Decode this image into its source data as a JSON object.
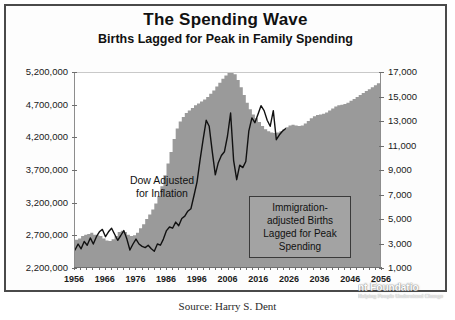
{
  "chart_data": {
    "type": "area",
    "title": "The Spending Wave",
    "subtitle": "Births Lagged for Peak in Family Spending",
    "xlabel": "",
    "ylabel": "",
    "grid": false,
    "legend_position": "none",
    "x": [
      1956,
      1957,
      1958,
      1959,
      1960,
      1961,
      1962,
      1963,
      1964,
      1965,
      1966,
      1967,
      1968,
      1969,
      1970,
      1971,
      1972,
      1973,
      1974,
      1975,
      1976,
      1977,
      1978,
      1979,
      1980,
      1981,
      1982,
      1983,
      1984,
      1985,
      1986,
      1987,
      1988,
      1989,
      1990,
      1991,
      1992,
      1993,
      1994,
      1995,
      1996,
      1997,
      1998,
      1999,
      2000,
      2001,
      2002,
      2003,
      2004,
      2005,
      2006,
      2007,
      2008,
      2009,
      2010,
      2011,
      2012,
      2013,
      2014,
      2015,
      2016,
      2017,
      2018,
      2019,
      2020,
      2021,
      2022,
      2023,
      2024,
      2025,
      2026,
      2027,
      2028,
      2029,
      2030,
      2031,
      2032,
      2033,
      2034,
      2035,
      2036,
      2037,
      2038,
      2039,
      2040,
      2041,
      2042,
      2043,
      2044,
      2045,
      2046,
      2047,
      2048,
      2049,
      2050,
      2051,
      2052,
      2053,
      2054,
      2055,
      2056
    ],
    "x_tick_labels": [
      "1956",
      "1966",
      "1976",
      "1986",
      "1996",
      "2006",
      "2016",
      "2026",
      "2036",
      "2046",
      "2056"
    ],
    "axes": [
      {
        "name": "left",
        "title": "Immigration-adjusted Births Lagged for Peak Spending",
        "ticks": [
          "2,200,000",
          "2,700,000",
          "3,200,000",
          "3,700,000",
          "4,200,000",
          "4,700,000",
          "5,200,000"
        ],
        "range": [
          2200000,
          5200000
        ],
        "tick_step": 500000
      },
      {
        "name": "right",
        "title": "Dow Adjusted for Inflation",
        "ticks": [
          "1,000",
          "3,000",
          "5,000",
          "7,000",
          "9,000",
          "11,000",
          "13,000",
          "15,000",
          "17,000"
        ],
        "range": [
          1000,
          17000
        ],
        "tick_step": 2000
      }
    ],
    "series": [
      {
        "name": "Immigration-adjusted Births Lagged for Peak Spending",
        "type": "area",
        "axis": "left",
        "color": "#9a9a9a",
        "values": [
          2620000,
          2640000,
          2680000,
          2700000,
          2710000,
          2730000,
          2700000,
          2690000,
          2680000,
          2640000,
          2610000,
          2600000,
          2630000,
          2680000,
          2740000,
          2760000,
          2740000,
          2700000,
          2680000,
          2690000,
          2730000,
          2800000,
          2860000,
          2940000,
          3010000,
          3090000,
          3180000,
          3300000,
          3450000,
          3620000,
          3800000,
          3980000,
          4180000,
          4340000,
          4450000,
          4520000,
          4580000,
          4620000,
          4660000,
          4700000,
          4730000,
          4760000,
          4790000,
          4830000,
          4880000,
          4930000,
          4990000,
          5050000,
          5110000,
          5160000,
          5200000,
          5230000,
          5180000,
          5090000,
          4980000,
          4860000,
          4740000,
          4640000,
          4560000,
          4500000,
          4440000,
          4380000,
          4330000,
          4300000,
          4280000,
          4270000,
          4280000,
          4300000,
          4330000,
          4360000,
          4390000,
          4400000,
          4390000,
          4380000,
          4390000,
          4420000,
          4460000,
          4500000,
          4530000,
          4550000,
          4560000,
          4570000,
          4590000,
          4620000,
          4650000,
          4680000,
          4700000,
          4710000,
          4720000,
          4740000,
          4770000,
          4800000,
          4830000,
          4860000,
          4890000,
          4920000,
          4950000,
          4980000,
          5010000,
          5040000,
          5070000
        ]
      },
      {
        "name": "Dow Adjusted for Inflation",
        "type": "line",
        "axis": "right",
        "color": "#111111",
        "values": [
          2400,
          2900,
          2500,
          3100,
          2800,
          3400,
          2900,
          3500,
          3900,
          4100,
          3500,
          3900,
          4200,
          3700,
          3200,
          3600,
          4000,
          3300,
          2400,
          2900,
          3300,
          2900,
          2700,
          2600,
          2800,
          2500,
          2300,
          2900,
          2800,
          3300,
          4000,
          4300,
          4200,
          4700,
          4400,
          5000,
          5200,
          5600,
          5800,
          6900,
          8000,
          9800,
          11500,
          13100,
          12600,
          10500,
          8600,
          9600,
          10200,
          10500,
          11800,
          13700,
          9800,
          8200,
          9400,
          9200,
          9700,
          12200,
          13300,
          12900,
          13600,
          14300,
          13900,
          13100,
          12600,
          13900,
          11500,
          11900,
          12200,
          12400,
          0,
          0,
          0,
          0,
          0,
          0,
          0,
          0,
          0,
          0,
          0,
          0,
          0,
          0,
          0,
          0,
          0,
          0,
          0,
          0,
          0,
          0,
          0,
          0,
          0,
          0,
          0,
          0,
          0,
          0,
          0
        ]
      }
    ],
    "annotations": [
      {
        "name": "dow-annotation",
        "text": "Dow Adjusted for Inflation",
        "lines": [
          "Dow Adjusted",
          "for Inflation"
        ],
        "boxed": false
      },
      {
        "name": "births-annotation",
        "text": "Immigration-adjusted Births Lagged for Peak Spending",
        "lines": [
          "Immigration-",
          "adjusted Births",
          "Lagged for Peak",
          "Spending"
        ],
        "boxed": true
      }
    ],
    "colors": {
      "area_fill": "#9a9a9a",
      "line": "#111111",
      "annotation_box_fill": "#a3a3a3",
      "border": "#4a4a4a",
      "background": "#ffffff"
    }
  },
  "watermark": {
    "name": "H.S. Dent Foundation",
    "visible_name_fragment": "nt Foundatio",
    "tagline": "Helping People Understand Change"
  },
  "footer": {
    "caption": "Source: Harry S. Dent"
  }
}
